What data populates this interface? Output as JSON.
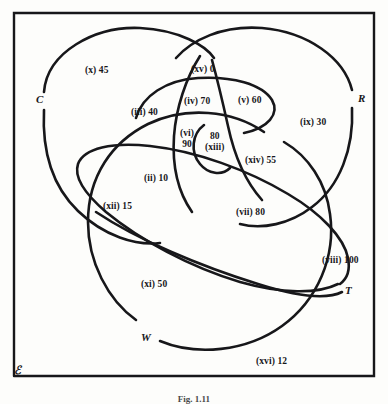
{
  "figure": {
    "caption": "Fig. 1.11",
    "universe_symbol": "ℰ",
    "background_color": "#fdfdfb",
    "stroke_color": "#17171a",
    "border": {
      "x": 13,
      "y": 12,
      "width": 362,
      "height": 366
    }
  },
  "sets": [
    {
      "id": "C",
      "label": "C",
      "x": 36,
      "y": 99
    },
    {
      "id": "R",
      "label": "R",
      "x": 360,
      "y": 98
    },
    {
      "id": "T",
      "label": "T",
      "x": 345,
      "y": 290
    },
    {
      "id": "W",
      "label": "W",
      "x": 144,
      "y": 338
    }
  ],
  "regions": [
    {
      "id": "i",
      "roman": "(xv)",
      "value": "0",
      "label": "(xv) 0",
      "x": 191,
      "y": 64,
      "align": "inline"
    },
    {
      "id": "ii",
      "roman": "(ii)",
      "value": "10",
      "label": "(ii) 10",
      "x": 144,
      "y": 173,
      "align": "inline"
    },
    {
      "id": "iii",
      "roman": "(iii)",
      "value": "40",
      "label": "(iii) 40",
      "x": 131,
      "y": 107,
      "align": "inline"
    },
    {
      "id": "iv",
      "roman": "(iv)",
      "value": "70",
      "label": "(iv) 70",
      "x": 184,
      "y": 96,
      "align": "inline"
    },
    {
      "id": "v",
      "roman": "(v)",
      "value": "60",
      "label": "(v) 60",
      "x": 238,
      "y": 95,
      "align": "inline"
    },
    {
      "id": "vi",
      "roman": "(vi)",
      "value": "90",
      "line1": "(vi)",
      "line2": "90",
      "label": "(vi) 90",
      "x": 180,
      "y": 131,
      "align": "stack"
    },
    {
      "id": "vii",
      "roman": "(vii)",
      "value": "80",
      "label": "(vii) 80",
      "x": 236,
      "y": 207,
      "align": "inline"
    },
    {
      "id": "viii",
      "roman": "(viii)",
      "value": "100",
      "label": "(viii) 100",
      "x": 325,
      "y": 255,
      "align": "inline"
    },
    {
      "id": "ix",
      "roman": "(ix)",
      "value": "30",
      "label": "(ix) 30",
      "x": 300,
      "y": 117,
      "align": "inline"
    },
    {
      "id": "x",
      "roman": "(x)",
      "value": "45",
      "label": "(x) 45",
      "x": 85,
      "y": 65,
      "align": "inline"
    },
    {
      "id": "xi",
      "roman": "(xi)",
      "value": "50",
      "label": "(xi) 50",
      "x": 141,
      "y": 279,
      "align": "inline"
    },
    {
      "id": "xii",
      "roman": "(xii)",
      "value": "15",
      "label": "(xii) 15",
      "x": 103,
      "y": 201,
      "align": "inline"
    },
    {
      "id": "xiii",
      "roman": "(xiii)",
      "value": "80",
      "line1": "80",
      "line2": "(xiii)",
      "label": "80 (xiii)",
      "x": 208,
      "y": 133,
      "align": "stack"
    },
    {
      "id": "xiv",
      "roman": "(xiv)",
      "value": "55",
      "label": "(xiv) 55",
      "x": 245,
      "y": 155,
      "align": "inline"
    },
    {
      "id": "xvi",
      "roman": "(xvi)",
      "value": "12",
      "label": "(xvi) 12",
      "x": 256,
      "y": 356,
      "align": "inline"
    }
  ]
}
